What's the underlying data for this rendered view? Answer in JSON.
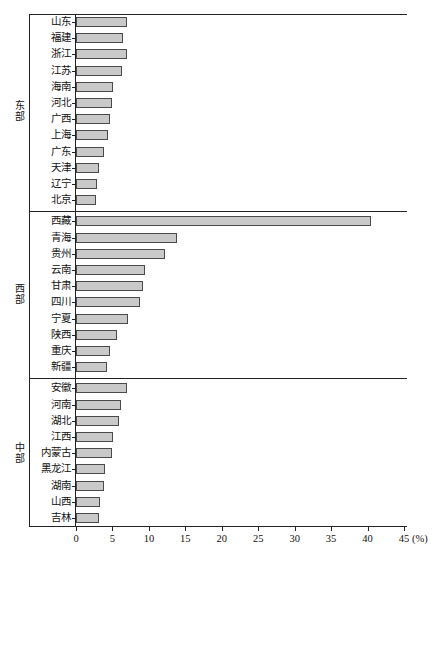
{
  "chart_data": {
    "type": "bar",
    "orientation": "horizontal",
    "title": "",
    "xlabel": "(%)",
    "ylabel": "",
    "xlim": [
      0,
      45
    ],
    "xticks": [
      0,
      5,
      10,
      15,
      20,
      25,
      30,
      35,
      40,
      45
    ],
    "grid": false,
    "legend": null,
    "bar_color": "#c9c9c9",
    "bar_border_color": "#4a4a4a",
    "groups": [
      {
        "name": "东部",
        "categories": [
          "山东",
          "福建",
          "浙江",
          "江苏",
          "海南",
          "河北",
          "广西",
          "上海",
          "广东",
          "天津",
          "辽宁",
          "北京"
        ],
        "values": [
          7.0,
          6.5,
          7.0,
          6.3,
          5.1,
          5.0,
          4.6,
          4.4,
          3.9,
          3.2,
          2.9,
          2.8
        ]
      },
      {
        "name": "西部",
        "categories": [
          "西藏",
          "青海",
          "贵州",
          "云南",
          "甘肃",
          "四川",
          "宁夏",
          "陕西",
          "重庆",
          "新疆"
        ],
        "values": [
          40.5,
          13.8,
          12.2,
          9.4,
          9.2,
          8.8,
          7.2,
          5.6,
          4.7,
          4.3
        ]
      },
      {
        "name": "中部",
        "categories": [
          "安徽",
          "河南",
          "湖北",
          "江西",
          "内蒙古",
          "黑龙江",
          "湖南",
          "山西",
          "吉林"
        ],
        "values": [
          7.0,
          6.2,
          5.9,
          5.1,
          4.9,
          4.0,
          3.8,
          3.3,
          3.1
        ]
      }
    ]
  },
  "axis": {
    "unit_label": "(%)",
    "tick_labels": [
      "0",
      "5",
      "10",
      "15",
      "20",
      "25",
      "30",
      "35",
      "40",
      "45"
    ]
  },
  "group_labels": {
    "east": "东部",
    "west": "西部",
    "central": "中部"
  }
}
